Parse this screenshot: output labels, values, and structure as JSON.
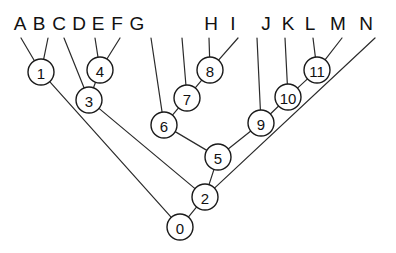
{
  "figure": {
    "width": 396,
    "height": 253,
    "background": "#ffffff",
    "line_color": "#2b2b2b",
    "node_fill": "#ffffff",
    "node_stroke": "#1a1a1a",
    "text_color": "#111111"
  },
  "leaves": [
    {
      "id": "A",
      "label": "A",
      "label_x": 20,
      "label_y": 30,
      "tip_x": 21,
      "tip_y": 38
    },
    {
      "id": "B",
      "label": "B",
      "label_x": 39,
      "label_y": 30,
      "tip_x": 48,
      "tip_y": 38
    },
    {
      "id": "C",
      "label": "C",
      "label_x": 59,
      "label_y": 30,
      "tip_x": 64,
      "tip_y": 38
    },
    {
      "id": "D",
      "label": "D",
      "label_x": 79,
      "label_y": 30,
      "tip_x": 95,
      "tip_y": 38
    },
    {
      "id": "E",
      "label": "E",
      "label_x": 98,
      "label_y": 30,
      "tip_x": 120,
      "tip_y": 38
    },
    {
      "id": "F",
      "label": "F",
      "label_x": 117,
      "label_y": 30,
      "tip_x": 151,
      "tip_y": 38
    },
    {
      "id": "G",
      "label": "G",
      "label_x": 137,
      "label_y": 30,
      "tip_x": 182,
      "tip_y": 38
    },
    {
      "id": "H",
      "label": "H",
      "label_x": 211,
      "label_y": 30,
      "tip_x": 209,
      "tip_y": 38
    },
    {
      "id": "I",
      "label": "I",
      "label_x": 233,
      "label_y": 30,
      "tip_x": 238,
      "tip_y": 38
    },
    {
      "id": "J",
      "label": "J",
      "label_x": 266,
      "label_y": 30,
      "tip_x": 257,
      "tip_y": 38
    },
    {
      "id": "K",
      "label": "K",
      "label_x": 288,
      "label_y": 30,
      "tip_x": 285,
      "tip_y": 38
    },
    {
      "id": "L",
      "label": "L",
      "label_x": 310,
      "label_y": 30,
      "tip_x": 313,
      "tip_y": 38
    },
    {
      "id": "M",
      "label": "M",
      "label_x": 338,
      "label_y": 30,
      "tip_x": 342,
      "tip_y": 38
    },
    {
      "id": "N",
      "label": "N",
      "label_x": 366,
      "label_y": 30,
      "tip_x": 375,
      "tip_y": 38
    }
  ],
  "nodes": [
    {
      "id": "0",
      "label": "0",
      "x": 180,
      "y": 227,
      "r": 13
    },
    {
      "id": "1",
      "label": "1",
      "x": 41,
      "y": 72,
      "r": 13
    },
    {
      "id": "2",
      "label": "2",
      "x": 205,
      "y": 197,
      "r": 13
    },
    {
      "id": "3",
      "label": "3",
      "x": 89,
      "y": 100,
      "r": 13
    },
    {
      "id": "4",
      "label": "4",
      "x": 100,
      "y": 70,
      "r": 13
    },
    {
      "id": "5",
      "label": "5",
      "x": 218,
      "y": 157,
      "r": 13
    },
    {
      "id": "6",
      "label": "6",
      "x": 164,
      "y": 125,
      "r": 13
    },
    {
      "id": "7",
      "label": "7",
      "x": 187,
      "y": 98,
      "r": 13
    },
    {
      "id": "8",
      "label": "8",
      "x": 210,
      "y": 70,
      "r": 13
    },
    {
      "id": "9",
      "label": "9",
      "x": 261,
      "y": 123,
      "r": 13
    },
    {
      "id": "10",
      "label": "10",
      "x": 288,
      "y": 97,
      "r": 13
    },
    {
      "id": "11",
      "label": "11",
      "x": 317,
      "y": 70,
      "r": 13
    }
  ],
  "edges": [
    {
      "from": "A",
      "to": "1",
      "kind": "leaf"
    },
    {
      "from": "B",
      "to": "1",
      "kind": "leaf"
    },
    {
      "from": "C",
      "to": "3",
      "kind": "leaf"
    },
    {
      "from": "D",
      "to": "4",
      "kind": "leaf"
    },
    {
      "from": "E",
      "to": "4",
      "kind": "leaf"
    },
    {
      "from": "F",
      "to": "6",
      "kind": "leaf"
    },
    {
      "from": "G",
      "to": "7",
      "kind": "leaf"
    },
    {
      "from": "H",
      "to": "8",
      "kind": "leaf"
    },
    {
      "from": "I",
      "to": "8",
      "kind": "leaf"
    },
    {
      "from": "J",
      "to": "9",
      "kind": "leaf"
    },
    {
      "from": "K",
      "to": "10",
      "kind": "leaf"
    },
    {
      "from": "L",
      "to": "11",
      "kind": "leaf"
    },
    {
      "from": "M",
      "to": "11",
      "kind": "leaf"
    },
    {
      "from": "N",
      "to": "2",
      "kind": "leaf"
    },
    {
      "from": "1",
      "to": "0",
      "kind": "internal"
    },
    {
      "from": "4",
      "to": "3",
      "kind": "internal"
    },
    {
      "from": "3",
      "to": "2",
      "kind": "internal"
    },
    {
      "from": "8",
      "to": "7",
      "kind": "internal"
    },
    {
      "from": "7",
      "to": "6",
      "kind": "internal"
    },
    {
      "from": "6",
      "to": "5",
      "kind": "internal"
    },
    {
      "from": "11",
      "to": "10",
      "kind": "internal"
    },
    {
      "from": "10",
      "to": "9",
      "kind": "internal"
    },
    {
      "from": "9",
      "to": "5",
      "kind": "internal"
    },
    {
      "from": "5",
      "to": "2",
      "kind": "internal"
    },
    {
      "from": "2",
      "to": "0",
      "kind": "internal"
    }
  ]
}
